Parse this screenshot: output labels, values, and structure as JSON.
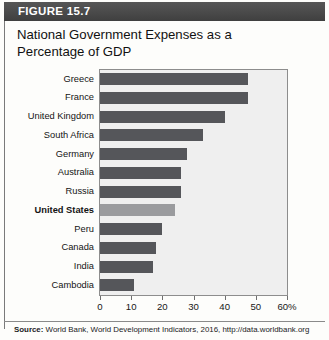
{
  "figure": {
    "header_label": "FIGURE 15.7",
    "title": "National Government Expenses as a Percentage of GDP",
    "source_prefix": "Source:",
    "source_text": " World Bank, World Development Indicators, 2016, http://data.worldbank.org"
  },
  "colors": {
    "header_background": "#4c4c4c",
    "header_text": "#ffffff",
    "bar_default": "#55565a",
    "bar_highlight": "#9a9b9e",
    "plot_background": "#efefef",
    "plot_border": "#8d8d8d"
  },
  "axis": {
    "tick_labels": [
      "0",
      "10",
      "20",
      "30",
      "40",
      "50",
      "60%"
    ],
    "tick_values": [
      0,
      10,
      20,
      30,
      40,
      50,
      60
    ]
  },
  "chart_data": {
    "type": "bar",
    "orientation": "horizontal",
    "title": "National Government Expenses as a Percentage of GDP",
    "xlabel": "",
    "ylabel": "",
    "xlim": [
      0,
      60
    ],
    "grid": false,
    "legend": "none",
    "categories": [
      "Greece",
      "France",
      "United Kingdom",
      "South Africa",
      "Germany",
      "Australia",
      "Russia",
      "United States",
      "Peru",
      "Canada",
      "India",
      "Cambodia"
    ],
    "values": [
      47.5,
      47.5,
      40,
      33,
      28,
      26,
      26,
      24,
      20,
      18,
      17,
      11
    ],
    "highlighted_category": "United States",
    "annotations": [
      "United States bar is shaded lighter and its label is bold for emphasis"
    ],
    "source": "World Bank, World Development Indicators, 2016, http://data.worldbank.org"
  }
}
